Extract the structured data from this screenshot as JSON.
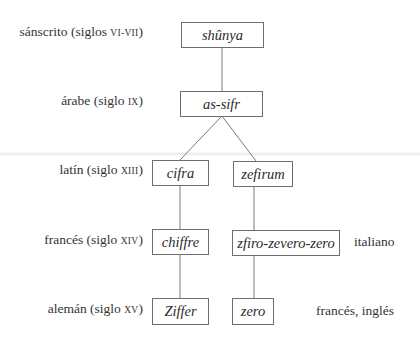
{
  "diagram": {
    "stages": [
      {
        "language": "sánscrito",
        "period_prefix": "(siglos ",
        "period": "vi-vii",
        "period_suffix": ")"
      },
      {
        "language": "árabe",
        "period_prefix": "(siglo ",
        "period": "ix",
        "period_suffix": ")"
      },
      {
        "language": "latín",
        "period_prefix": "(siglo ",
        "period": "xiii",
        "period_suffix": ")"
      },
      {
        "language": "francés",
        "period_prefix": "(siglo ",
        "period": "xiv",
        "period_suffix": ")"
      },
      {
        "language": "alemán",
        "period_prefix": "(siglo ",
        "period": "xv",
        "period_suffix": ")"
      }
    ],
    "nodes": {
      "shunya": "shûnya",
      "as_sifr": "as-sifr",
      "cifra": "cifra",
      "zefirum": "zefirum",
      "chiffre": "chiffre",
      "zfiro": "zfiro-zevero-zero",
      "ziffer": "Ziffer",
      "zero": "zero"
    },
    "side_labels": {
      "italiano": "italiano",
      "frances_ingles": "francés, inglés"
    },
    "edges": [
      [
        "shûnya",
        "as-sifr"
      ],
      [
        "as-sifr",
        "cifra"
      ],
      [
        "as-sifr",
        "zefirum"
      ],
      [
        "cifra",
        "chiffre"
      ],
      [
        "zefirum",
        "zfiro-zevero-zero"
      ],
      [
        "chiffre",
        "Ziffer"
      ],
      [
        "zfiro-zevero-zero",
        "zero"
      ]
    ]
  }
}
